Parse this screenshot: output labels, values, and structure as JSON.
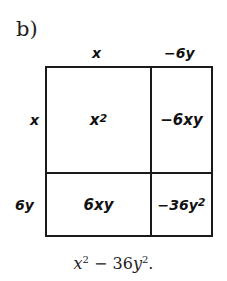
{
  "part_label": "b)",
  "columns": {
    "col1": "x",
    "col2": "−6y"
  },
  "rows": {
    "row1": "x",
    "row2": "6y"
  },
  "cells": {
    "r1c1": {
      "base": "x",
      "exp": "2"
    },
    "r1c2": {
      "text": "−6xy"
    },
    "r2c1": {
      "text": "6xy"
    },
    "r2c2": {
      "base": "−36y",
      "exp": "2"
    }
  },
  "result": {
    "term1_base": "x",
    "term1_exp": "2",
    "operator": " − 36",
    "term2_base": "y",
    "term2_exp": "2",
    "suffix": "."
  },
  "colors": {
    "ink": "#111111",
    "background": "#ffffff"
  }
}
